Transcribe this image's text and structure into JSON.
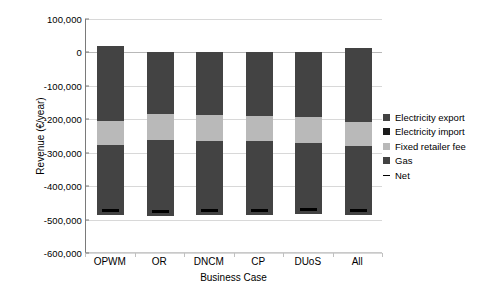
{
  "chart_data": {
    "type": "bar",
    "stacked": true,
    "title": "",
    "xlabel": "Business Case",
    "ylabel": "Revenue (€/year)",
    "categories": [
      "OPWM",
      "OR",
      "DNCM",
      "CP",
      "DUoS",
      "All"
    ],
    "ylim": [
      -600000,
      100000
    ],
    "ytick_values": [
      100000,
      0,
      -100000,
      -200000,
      -300000,
      -400000,
      -500000,
      -600000
    ],
    "ytick_labels": [
      "100,000",
      "0",
      "-100,000",
      "-200,000",
      "-300,000",
      "-400,000",
      "-500,000",
      "-600,000"
    ],
    "grid": true,
    "legend_position": "right",
    "series": [
      {
        "name": "Electricity export",
        "color": "#434343",
        "values": [
          18000,
          0,
          0,
          0,
          0,
          12000
        ]
      },
      {
        "name": "Electricity import",
        "color": "#1c1c1c",
        "values": [
          -205000,
          -185000,
          -188000,
          -190000,
          -193000,
          -208000
        ]
      },
      {
        "name": "Fixed retailer fee",
        "color": "#b9b9b9",
        "values": [
          -72000,
          -78000,
          -77000,
          -75000,
          -78000,
          -72000
        ]
      },
      {
        "name": "Gas",
        "color": "#434343",
        "values": [
          -208000,
          -225000,
          -222000,
          -220000,
          -213000,
          -208000
        ]
      },
      {
        "name": "Net",
        "color": "#000000",
        "values": [
          -485000,
          -488000,
          -487000,
          -485000,
          -484000,
          -487000
        ]
      }
    ],
    "segment_tops": {
      "note": "cumulative stacked boundaries in € for each category",
      "OPWM": {
        "positive_top": 18000,
        "export_bottom": 0,
        "import_top": -205000,
        "fee_top": -277000,
        "gas_bottom": -485000,
        "net": -485000
      },
      "OR": {
        "positive_top": 0,
        "export_bottom": 0,
        "import_top": -185000,
        "fee_top": -263000,
        "gas_bottom": -488000,
        "net": -488000
      },
      "DNCM": {
        "positive_top": 0,
        "export_bottom": 0,
        "import_top": -188000,
        "fee_top": -265000,
        "gas_bottom": -487000,
        "net": -487000
      },
      "CP": {
        "positive_top": 0,
        "export_bottom": 0,
        "import_top": -190000,
        "fee_top": -265000,
        "gas_bottom": -485000,
        "net": -485000
      },
      "DUoS": {
        "positive_top": 0,
        "export_bottom": 0,
        "import_top": -193000,
        "fee_top": -271000,
        "gas_bottom": -484000,
        "net": -484000
      },
      "All": {
        "positive_top": 12000,
        "export_bottom": 0,
        "import_top": -208000,
        "fee_top": -280000,
        "gas_bottom": -487000,
        "net": -487000
      }
    }
  },
  "legend": {
    "items": [
      {
        "label": "Electricity export",
        "swatch": "#434343",
        "marker": "square"
      },
      {
        "label": "Electricity import",
        "swatch": "#1c1c1c",
        "marker": "square"
      },
      {
        "label": "Fixed retailer fee",
        "swatch": "#b9b9b9",
        "marker": "square"
      },
      {
        "label": "Gas",
        "swatch": "#434343",
        "marker": "square"
      },
      {
        "label": "Net",
        "swatch": "#000000",
        "marker": "dash"
      }
    ]
  }
}
